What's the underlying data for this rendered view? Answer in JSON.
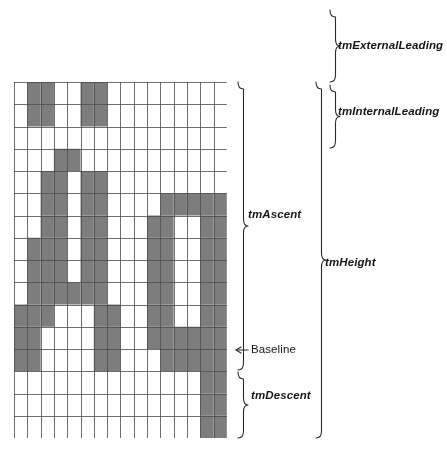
{
  "colors": {
    "fill": "#7d7d7d",
    "grid_line": "#4a4a4a",
    "background": "#ffffff",
    "brace": "#2a2a2a",
    "text": "#151515"
  },
  "grid": {
    "columns": 16,
    "rows": 16,
    "cell_width": 13.3,
    "cell_height": 22.25,
    "origin_x": 14,
    "origin_y": 82,
    "filled_cells": [
      [
        1,
        0
      ],
      [
        2,
        0
      ],
      [
        5,
        0
      ],
      [
        6,
        0
      ],
      [
        1,
        1
      ],
      [
        2,
        1
      ],
      [
        5,
        1
      ],
      [
        6,
        1
      ],
      [
        3,
        3
      ],
      [
        4,
        3
      ],
      [
        2,
        4
      ],
      [
        3,
        4
      ],
      [
        5,
        4
      ],
      [
        6,
        4
      ],
      [
        2,
        5
      ],
      [
        3,
        5
      ],
      [
        5,
        5
      ],
      [
        6,
        5
      ],
      [
        11,
        5
      ],
      [
        12,
        5
      ],
      [
        13,
        5
      ],
      [
        14,
        5
      ],
      [
        15,
        5
      ],
      [
        2,
        6
      ],
      [
        3,
        6
      ],
      [
        5,
        6
      ],
      [
        6,
        6
      ],
      [
        10,
        6
      ],
      [
        11,
        6
      ],
      [
        14,
        6
      ],
      [
        15,
        6
      ],
      [
        1,
        7
      ],
      [
        2,
        7
      ],
      [
        3,
        7
      ],
      [
        5,
        7
      ],
      [
        6,
        7
      ],
      [
        10,
        7
      ],
      [
        11,
        7
      ],
      [
        14,
        7
      ],
      [
        15,
        7
      ],
      [
        1,
        8
      ],
      [
        2,
        8
      ],
      [
        3,
        8
      ],
      [
        5,
        8
      ],
      [
        6,
        8
      ],
      [
        10,
        8
      ],
      [
        11,
        8
      ],
      [
        14,
        8
      ],
      [
        15,
        8
      ],
      [
        1,
        9
      ],
      [
        2,
        9
      ],
      [
        3,
        9
      ],
      [
        4,
        9
      ],
      [
        5,
        9
      ],
      [
        6,
        9
      ],
      [
        10,
        9
      ],
      [
        11,
        9
      ],
      [
        14,
        9
      ],
      [
        15,
        9
      ],
      [
        0,
        10
      ],
      [
        1,
        10
      ],
      [
        2,
        10
      ],
      [
        6,
        10
      ],
      [
        7,
        10
      ],
      [
        10,
        10
      ],
      [
        11,
        10
      ],
      [
        14,
        10
      ],
      [
        15,
        10
      ],
      [
        0,
        11
      ],
      [
        1,
        11
      ],
      [
        6,
        11
      ],
      [
        7,
        11
      ],
      [
        10,
        11
      ],
      [
        11,
        11
      ],
      [
        12,
        11
      ],
      [
        13,
        11
      ],
      [
        14,
        11
      ],
      [
        15,
        11
      ],
      [
        0,
        12
      ],
      [
        1,
        12
      ],
      [
        6,
        12
      ],
      [
        7,
        12
      ],
      [
        11,
        12
      ],
      [
        12,
        12
      ],
      [
        13,
        12
      ],
      [
        14,
        12
      ],
      [
        15,
        12
      ],
      [
        14,
        13
      ],
      [
        15,
        13
      ],
      [
        14,
        14
      ],
      [
        15,
        14
      ],
      [
        14,
        15
      ],
      [
        15,
        15
      ]
    ]
  },
  "labels": {
    "external_leading": "tmExternalLeading",
    "internal_leading": "tmInternalLeading",
    "ascent": "tmAscent",
    "height": "tmHeight",
    "baseline": "Baseline",
    "descent": "tmDescent"
  },
  "braces": {
    "external_leading": {
      "top": 10,
      "bottom": 82,
      "x": 330
    },
    "internal_leading": {
      "top": 85,
      "bottom": 148,
      "x": 330
    },
    "ascent": {
      "top": 82,
      "bottom": 370,
      "x": 238
    },
    "height": {
      "top": 82,
      "bottom": 438,
      "x": 316
    },
    "descent": {
      "top": 372,
      "bottom": 438,
      "x": 238
    },
    "baseline_pointer": {
      "y": 350,
      "from_x": 236,
      "to_x": 248
    }
  }
}
